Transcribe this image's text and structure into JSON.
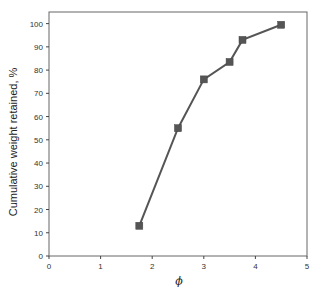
{
  "chart_data": {
    "type": "line",
    "title": "",
    "xlabel": "ϕ",
    "ylabel": "Cumulative weight retained, %",
    "xlim": [
      0,
      5
    ],
    "ylim": [
      0,
      105
    ],
    "x_ticks": [
      0,
      1,
      2,
      3,
      4,
      5
    ],
    "y_ticks": [
      0,
      10,
      20,
      30,
      40,
      50,
      60,
      70,
      80,
      90,
      100
    ],
    "grid": false,
    "legend": null,
    "marker": "square",
    "series": [
      {
        "name": "Cumulative weight retained",
        "x": [
          1.75,
          2.5,
          3.0,
          3.5,
          3.75,
          4.5
        ],
        "y": [
          13,
          55,
          76,
          83.5,
          93,
          99.5
        ],
        "color": "#555555"
      }
    ]
  },
  "colors": {
    "line": "#555555",
    "marker": "#555555",
    "axis": "#444444"
  }
}
